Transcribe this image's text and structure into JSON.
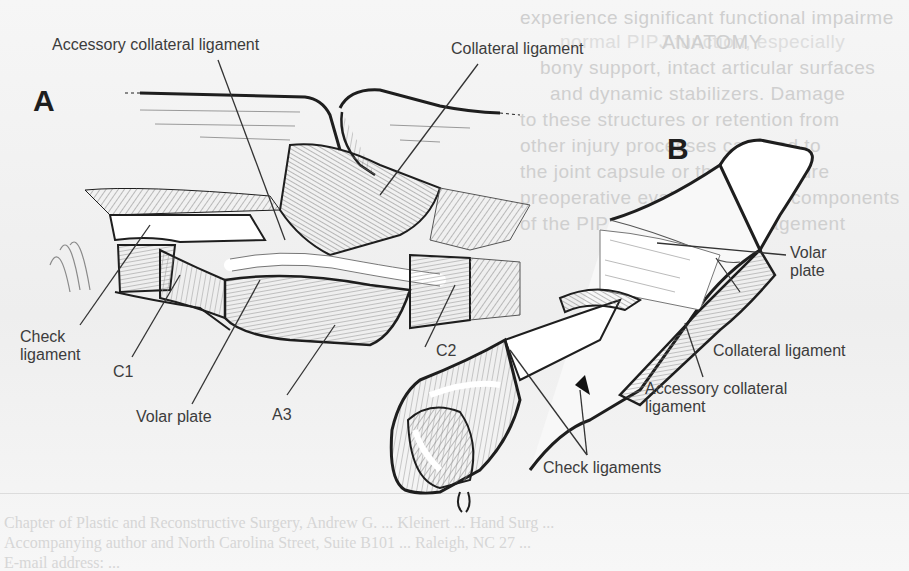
{
  "figure": {
    "panels": [
      {
        "id": "A",
        "letter": "A"
      },
      {
        "id": "B",
        "letter": "B"
      }
    ],
    "panel_a_labels": {
      "accessory_collateral_ligament": "Accessory collateral ligament",
      "collateral_ligament": "Collateral ligament",
      "check_ligament_line1": "Check",
      "check_ligament_line2": "ligament",
      "c1": "C1",
      "volar_plate": "Volar plate",
      "a3": "A3",
      "c2": "C2"
    },
    "panel_b_labels": {
      "volar_plate_line1": "Volar",
      "volar_plate_line2": "plate",
      "collateral_ligament": "Collateral ligament",
      "accessory_collateral_line1": "Accessory collateral",
      "accessory_collateral_line2": "ligament",
      "check_ligaments": "Check ligaments"
    }
  },
  "background_page": {
    "heading_fragment": "ANATOMY",
    "right_column_lines": [
      "experience significant functional impairme",
      "normal PIPJ function, especially",
      "bony support, intact articular surfaces",
      "and dynamic stabilizers. Damage",
      "to these structures or retention from",
      "other injury processes can lead to",
      "the joint capsule or the contracture",
      "preoperative evaluation of the components",
      "of the PIPJ and careful management"
    ],
    "caption_lines": [
      "Chapter of Plastic and Reconstructive Surgery, Andrew G. ... Kleinert ... Hand Surg ...",
      "Accompanying author and North Carolina Street, Suite B101 ... Raleigh, NC 27 ...",
      "E-mail address: ..."
    ]
  },
  "colors": {
    "ink": "#1e1e1e",
    "label": "#3c3c3c",
    "hatch": "#8a8a8a",
    "background": "#f4f4f4",
    "ghost_text": "#cfcfcf"
  }
}
